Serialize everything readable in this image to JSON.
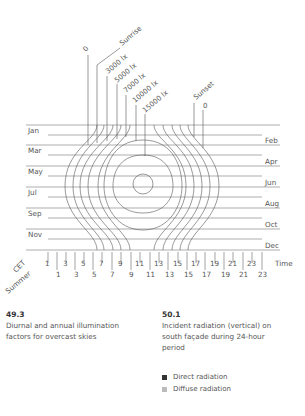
{
  "figure_left": {
    "number": "49.3",
    "caption_line1": "Diurnal and annual illumination",
    "caption_line2": "factors for overcast skies"
  },
  "figure_right": {
    "number": "50.1",
    "caption_line1": "Incident radiation (vertical) on",
    "caption_line2": "south façade during 24-hour",
    "caption_line3": "period",
    "legend": [
      {
        "label": "Direct radiation",
        "color": "#333333"
      },
      {
        "label": "Diffuse radiation",
        "color": "#bbbbbb"
      }
    ]
  },
  "diagram": {
    "contour_labels": {
      "zero_left": "0",
      "sunrise": "Sunrise",
      "lx3000": "3000 lx",
      "lx5000": "5000 lx",
      "lx7000": "7000 lx",
      "lx10000": "10000 lx",
      "lx15000": "15000 lx",
      "sunset": "Sunset",
      "zero_right": "0"
    },
    "months_left": [
      "Jan",
      "Mar",
      "May",
      "Jul",
      "Sep",
      "Nov"
    ],
    "months_right": [
      "Feb",
      "Apr",
      "Jun",
      "Aug",
      "Oct",
      "Dec"
    ],
    "axis": {
      "cet_label": "CET",
      "summer_label": "Summer",
      "time_label": "Time",
      "cet_ticks": [
        "1",
        "3",
        "5",
        "7",
        "9",
        "11",
        "13",
        "15",
        "17",
        "19",
        "21",
        "23"
      ],
      "summer_ticks": [
        "1",
        "3",
        "5",
        "7",
        "9",
        "11",
        "13",
        "15",
        "17",
        "19",
        "21",
        "23"
      ]
    }
  }
}
